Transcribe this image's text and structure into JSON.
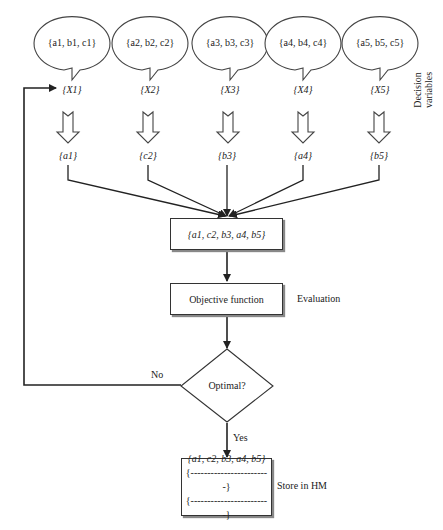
{
  "diagram": {
    "bubbles": [
      {
        "text": "{a1, b1, c1}",
        "x": 67
      },
      {
        "text": "{a2, b2, c2}",
        "x": 150
      },
      {
        "text": "{a3, b3, c3}",
        "x": 233
      },
      {
        "text": "{a4, b4, c4}",
        "x": 316
      },
      {
        "text": "{a5, b5, c5}",
        "x": 378
      }
    ],
    "variables": [
      "{X1}",
      "{X2}",
      "{X3}",
      "{X4}",
      "{X5}"
    ],
    "selected": [
      "{a1}",
      "{c2}",
      "{b3}",
      "{a4}",
      "{b5}"
    ],
    "side_label_decision": "Decision variables",
    "combined_box": "{a1, c2, b3, a4, b5}",
    "objective_box": "Objective function",
    "evaluation_label": "Evaluation",
    "decision_diamond": "Optimal?",
    "no_label": "No",
    "yes_label": "Yes",
    "store_box": {
      "lines": [
        "{a1, c2, b3, a4, b5}",
        "{------------------------}",
        "{------------------------}"
      ]
    },
    "store_label": "Store in HM",
    "colors": {
      "stroke": "#333333",
      "background": "#ffffff"
    }
  }
}
